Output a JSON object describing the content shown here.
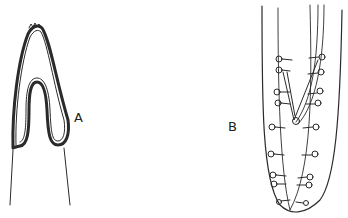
{
  "figure": {
    "panels": [
      {
        "id": "A",
        "label": "A",
        "description": "Anterior end with folded (invaginated) cuticular tube"
      },
      {
        "id": "B",
        "label": "B",
        "description": "Posterior end with paired papillae and spicule"
      }
    ],
    "colors": {
      "ink": "#2a2a2a",
      "background": "#ffffff"
    }
  }
}
